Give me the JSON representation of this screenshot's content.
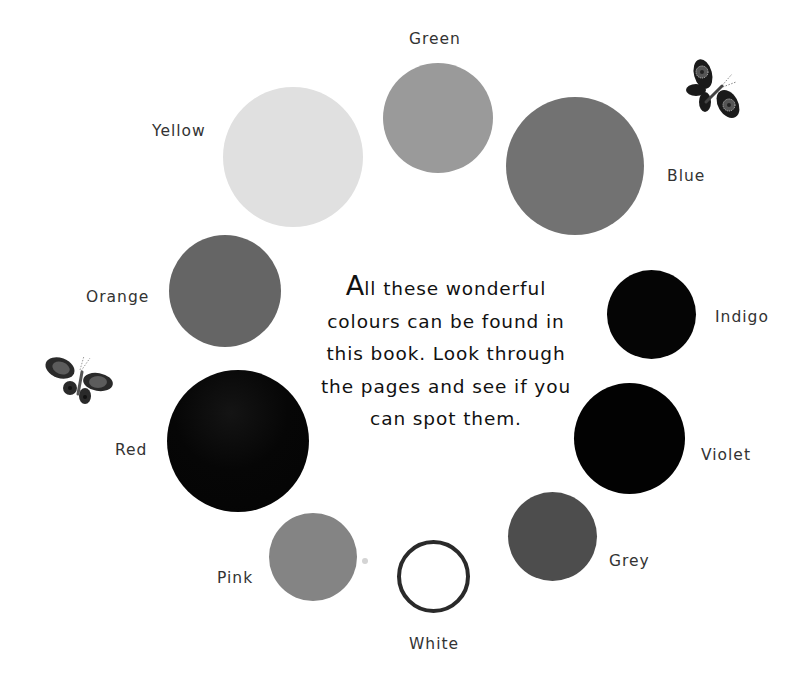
{
  "intro": {
    "dropcap": "A",
    "first_line_rest": "ll these wonderful",
    "line2": "colours can be found in",
    "line3": "this book. Look through",
    "line4": "the pages and see if you",
    "line5": "can spot them."
  },
  "swatches": [
    {
      "label": "Green",
      "color": "#9a9a9a",
      "cx": 438,
      "cy": 118,
      "d": 110,
      "label_x": 409,
      "label_y": 32
    },
    {
      "label": "Blue",
      "color": "#727272",
      "cx": 575,
      "cy": 166,
      "d": 138,
      "label_x": 667,
      "label_y": 169
    },
    {
      "label": "Indigo",
      "color": "#050505",
      "cx": 651,
      "cy": 314,
      "d": 89,
      "label_x": 715,
      "label_y": 310
    },
    {
      "label": "Violet",
      "color": "#020202",
      "cx": 629,
      "cy": 438,
      "d": 111,
      "label_x": 701,
      "label_y": 448
    },
    {
      "label": "Grey",
      "color": "#4d4d4d",
      "cx": 552,
      "cy": 536,
      "d": 89,
      "label_x": 609,
      "label_y": 554
    },
    {
      "label": "White",
      "color": "#ffffff",
      "cx": 433,
      "cy": 576,
      "d": 73,
      "label_x": 409,
      "label_y": 637,
      "outline": "#2a2a2a"
    },
    {
      "label": "Pink",
      "color": "#848484",
      "cx": 313,
      "cy": 557,
      "d": 88,
      "label_x": 217,
      "label_y": 571
    },
    {
      "label": "Red",
      "color": "#060606",
      "cx": 238,
      "cy": 441,
      "d": 142,
      "label_x": 115,
      "label_y": 443
    },
    {
      "label": "Orange",
      "color": "#656565",
      "cx": 225,
      "cy": 291,
      "d": 112,
      "label_x": 86,
      "label_y": 290
    },
    {
      "label": "Yellow",
      "color": "#e0e0e0",
      "cx": 293,
      "cy": 157,
      "d": 140,
      "label_x": 152,
      "label_y": 124
    }
  ],
  "decorations": {
    "butterfly_top_right": "butterfly-icon",
    "butterfly_left": "butterfly-icon"
  }
}
